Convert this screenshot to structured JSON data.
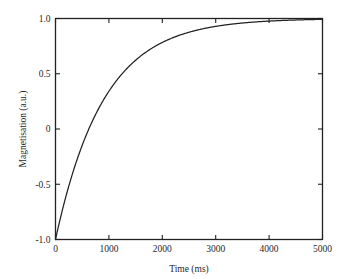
{
  "chart_data": {
    "type": "line",
    "title": "",
    "xlabel": "Time (ms)",
    "ylabel": "Magnetisation (a.u.)",
    "xlim": [
      0,
      5000
    ],
    "ylim": [
      -1.0,
      1.0
    ],
    "grid": false,
    "legend": "none",
    "xticks": [
      0,
      1000,
      2000,
      3000,
      4000,
      5000
    ],
    "xtick_labels": [
      "0",
      "1000",
      "2000",
      "3000",
      "4000",
      "5000"
    ],
    "yticks": [
      -1.0,
      -0.5,
      0,
      0.5,
      1.0
    ],
    "ytick_labels": [
      "-1.0",
      "-0.5",
      "0",
      "0.5",
      "1.0"
    ],
    "series": [
      {
        "name": "Inversion recovery",
        "color": "#222222",
        "equation": "M(t) = 1 - 2*exp(-t/900)",
        "x": [
          0,
          100,
          200,
          300,
          400,
          500,
          600,
          700,
          800,
          900,
          1000,
          1200,
          1400,
          1600,
          1800,
          2000,
          2200,
          2400,
          2600,
          2800,
          3000,
          3200,
          3400,
          3600,
          3800,
          4000,
          4200,
          4400,
          4600,
          4800,
          5000
        ],
        "y": [
          -1.0,
          -0.79,
          -0.6,
          -0.43,
          -0.27,
          -0.13,
          -0.01,
          0.11,
          0.21,
          0.3,
          0.38,
          0.52,
          0.63,
          0.72,
          0.78,
          0.83,
          0.87,
          0.9,
          0.92,
          0.94,
          0.95,
          0.96,
          0.97,
          0.978,
          0.982,
          0.986,
          0.989,
          0.991,
          0.993,
          0.995,
          0.996
        ]
      }
    ]
  },
  "axes": {
    "x_title": "Time (ms)",
    "y_title": "Magnetisation (a.u.)"
  }
}
